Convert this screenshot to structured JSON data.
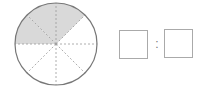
{
  "diagram": {
    "type": "fraction-circle",
    "total_sectors": 8,
    "shaded_sectors": 3,
    "shaded_color": "#d9d9d9",
    "stroke_color": "#777777",
    "dashed_color": "#999999"
  },
  "ratio": {
    "separator": ":",
    "left_box": "",
    "right_box": ""
  }
}
